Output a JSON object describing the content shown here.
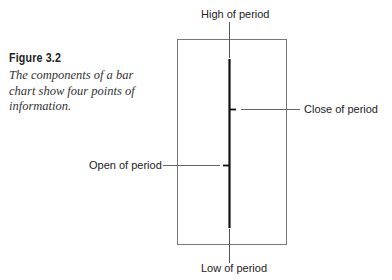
{
  "figure": {
    "title": "Figure 3.2",
    "caption": "The components of a bar chart show four points of information."
  },
  "diagram": {
    "labels": {
      "high": "High of period",
      "close": "Close of period",
      "open": "Open of period",
      "low": "Low of period"
    },
    "colors": {
      "bar": "#111111",
      "leader": "#555555",
      "frame": "#666666"
    }
  }
}
